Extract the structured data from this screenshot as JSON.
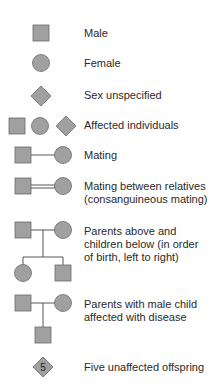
{
  "fill_color": "#a0a0a0",
  "stroke_color": "#6a6a6a",
  "legend": [
    {
      "symbol": "male-square",
      "label": "Male"
    },
    {
      "symbol": "female-circle",
      "label": "Female"
    },
    {
      "symbol": "unspecified-diamond",
      "label": "Sex unspecified"
    },
    {
      "symbol": "affected-individuals",
      "label": "Affected individuals"
    },
    {
      "symbol": "mating",
      "label": "Mating"
    },
    {
      "symbol": "consanguineous-mating",
      "label": "Mating between relatives\n(consanguineous mating)"
    },
    {
      "symbol": "parents-children",
      "label": "Parents above and\nchildren below (in order\nof birth, left to right)"
    },
    {
      "symbol": "affected-male-child",
      "label": "Parents with male child\naffected with disease"
    },
    {
      "symbol": "five-offspring",
      "label": "Five unaffected offspring",
      "count": "5"
    }
  ]
}
